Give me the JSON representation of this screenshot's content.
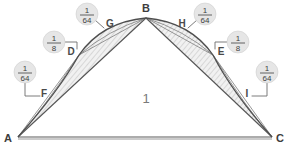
{
  "figure": {
    "background_color": "#ffffff",
    "center_area_label": "1",
    "stroke_color": "#4e4e4e",
    "badge_fill": "#e6e6e6",
    "hatch_color": "#bdbdbd"
  },
  "vertices": [
    {
      "id": "A",
      "label": "A",
      "x": 18,
      "y": 137
    },
    {
      "id": "B",
      "label": "B",
      "x": 146,
      "y": 18
    },
    {
      "id": "C",
      "label": "C",
      "x": 272,
      "y": 137
    }
  ],
  "points": [
    {
      "id": "D",
      "label": "D",
      "x": 79,
      "y": 55
    },
    {
      "id": "E",
      "label": "E",
      "x": 213,
      "y": 55
    },
    {
      "id": "F",
      "label": "F",
      "x": 46,
      "y": 93
    },
    {
      "id": "G",
      "label": "G",
      "x": 111,
      "y": 29
    },
    {
      "id": "H",
      "label": "H",
      "x": 180,
      "y": 29
    },
    {
      "id": "I",
      "label": "I",
      "x": 246,
      "y": 93
    }
  ],
  "badges": [
    {
      "id": "badge-d",
      "numerator": "1",
      "denominator": "8",
      "cx": 54,
      "cy": 42,
      "target": "D",
      "leader": "M 65,42 L 77,42 L 77,49"
    },
    {
      "id": "badge-g",
      "numerator": "1",
      "denominator": "64",
      "cx": 87,
      "cy": 14,
      "target": "G",
      "leader": "M 95,20 L 104,28"
    },
    {
      "id": "badge-f",
      "numerator": "1",
      "denominator": "64",
      "cx": 25,
      "cy": 72,
      "target": "F",
      "leader": "M 25,83 L 25,96 L 40,96"
    },
    {
      "id": "badge-e",
      "numerator": "1",
      "denominator": "8",
      "cx": 238,
      "cy": 42,
      "target": "E",
      "leader": "M 227,42 L 215,42 L 215,49"
    },
    {
      "id": "badge-h",
      "numerator": "1",
      "denominator": "64",
      "cx": 205,
      "cy": 14,
      "target": "H",
      "leader": "M 197,20 L 188,28"
    },
    {
      "id": "badge-i",
      "numerator": "1",
      "denominator": "64",
      "cx": 267,
      "cy": 72,
      "target": "I",
      "leader": "M 267,83 L 267,96 L 252,96"
    }
  ],
  "segments": [
    {
      "id": "base-ac",
      "from": "A",
      "to": "C",
      "kind": "straight"
    },
    {
      "id": "chord-ab",
      "from": "A",
      "to": "B",
      "kind": "straight"
    },
    {
      "id": "chord-bc",
      "from": "B",
      "to": "C",
      "kind": "straight"
    },
    {
      "id": "arc-adb",
      "from": "A",
      "to": "B",
      "via": "D",
      "kind": "parabolic-arc"
    },
    {
      "id": "arc-bec",
      "from": "B",
      "to": "C",
      "via": "E",
      "kind": "parabolic-arc"
    }
  ],
  "regions": [
    {
      "id": "triangle-abc",
      "label": "1",
      "kind": "triangle"
    },
    {
      "id": "lens-left",
      "label": "1/8",
      "kind": "hatched-segment"
    },
    {
      "id": "lens-right",
      "label": "1/8",
      "kind": "hatched-segment"
    }
  ]
}
